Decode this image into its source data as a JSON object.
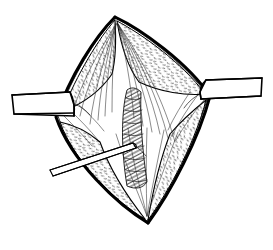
{
  "figure": {
    "kind": "line-art-illustration",
    "title": "",
    "caption": "",
    "background_color": "#ffffff",
    "ink_color": "#000000",
    "has_text_labels": false,
    "dimensions": {
      "width": 273,
      "height": 250
    }
  },
  "parts": [
    {
      "id": "incision-outline",
      "label": "Diamond-shaped incision margin",
      "description": "Thick black lens/rhombus outline, apex top and bottom, widest at mid-height"
    },
    {
      "id": "tissue-flap-upper-left",
      "label": "Upper left retracted tissue flap",
      "description": "Stippled crescent of everted tissue"
    },
    {
      "id": "tissue-flap-upper-right",
      "label": "Upper right retracted tissue flap",
      "description": "Stippled crescent of everted tissue"
    },
    {
      "id": "tissue-flap-lower-left",
      "label": "Lower left retracted tissue flap",
      "description": "Stippled crescent of everted tissue"
    },
    {
      "id": "tissue-flap-lower-right",
      "label": "Lower right retracted tissue flap",
      "description": "Stippled crescent of everted tissue"
    },
    {
      "id": "fascial-fibers",
      "label": "Radiating fascial fibers",
      "description": "Fine lines fanning from the superior apex down into the wound"
    },
    {
      "id": "central-structure",
      "label": "Central hatched structure",
      "description": "Vertical spindle with oblique hatch shading in the depth of the wound"
    },
    {
      "id": "retractor-left",
      "label": "Left retractor blade",
      "description": "Flat instrument entering horizontally from the left margin"
    },
    {
      "id": "retractor-right",
      "label": "Right retractor blade",
      "description": "Flat instrument entering horizontally from the right margin"
    },
    {
      "id": "probe-lower-left",
      "label": "Lower left probe",
      "description": "Slender instrument entering obliquely from the lower left"
    }
  ],
  "geometry": {
    "apex_top": {
      "x": 115,
      "y": 17
    },
    "apex_bottom": {
      "x": 148,
      "y": 223
    },
    "widest_left": {
      "x": 57,
      "y": 118
    },
    "widest_right": {
      "x": 209,
      "y": 96
    },
    "retractor_left_entry_y": 104,
    "retractor_right_entry_y": 86,
    "probe_entry": {
      "x": 50,
      "y": 168
    }
  }
}
